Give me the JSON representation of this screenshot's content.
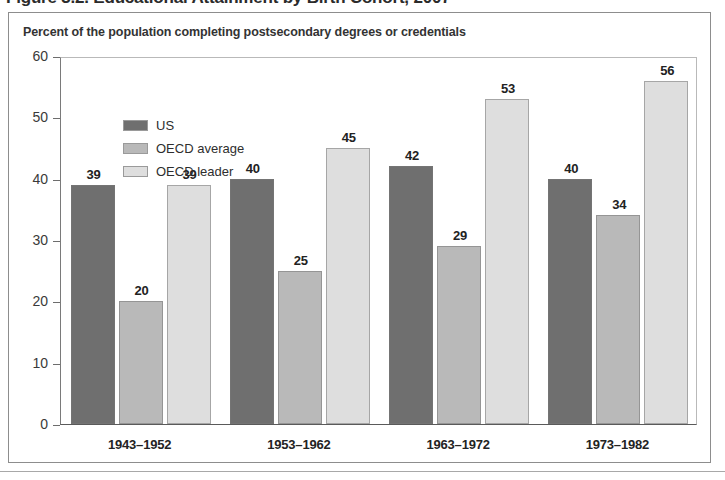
{
  "figure": {
    "title": "Figure 3.2. Educational Attainment by Birth Cohort, 2007",
    "subtitle": "Percent of the population completing postsecondary degrees or credentials"
  },
  "legend": {
    "items": [
      {
        "label": "US",
        "color": "#6f6f6f"
      },
      {
        "label": "OECD average",
        "color": "#b9b9b9"
      },
      {
        "label": "OECD leader",
        "color": "#dedede"
      }
    ]
  },
  "axis": {
    "y_ticks": [
      "0",
      "10",
      "20",
      "30",
      "40",
      "50",
      "60"
    ],
    "x_ticks": [
      "1943–1952",
      "1953–1962",
      "1963–1972",
      "1973–1982"
    ]
  },
  "chart_data": {
    "type": "bar",
    "title": "Figure 3.2. Educational Attainment by Birth Cohort, 2007",
    "subtitle": "Percent of the population completing postsecondary degrees or credentials",
    "xlabel": "",
    "ylabel": "",
    "ylim": [
      0,
      60
    ],
    "ytick_values": [
      0,
      10,
      20,
      30,
      40,
      50,
      60
    ],
    "grid": false,
    "legend_position": "top-left inside plot",
    "categories": [
      "1943–1952",
      "1953–1962",
      "1963–1972",
      "1973–1982"
    ],
    "series": [
      {
        "name": "US",
        "color": "#6f6f6f",
        "values": [
          39,
          40,
          42,
          40
        ]
      },
      {
        "name": "OECD average",
        "color": "#b9b9b9",
        "values": [
          20,
          25,
          29,
          34
        ]
      },
      {
        "name": "OECD leader",
        "color": "#dedede",
        "values": [
          39,
          45,
          53,
          56
        ]
      }
    ],
    "data_labels": [
      [
        "39",
        "20",
        "39"
      ],
      [
        "40",
        "25",
        "45"
      ],
      [
        "42",
        "29",
        "53"
      ],
      [
        "40",
        "34",
        "56"
      ]
    ]
  }
}
